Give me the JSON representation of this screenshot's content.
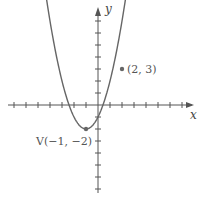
{
  "chart_data": {
    "type": "line",
    "title": "",
    "function": "y = (x + 1)^2 - 2",
    "xlabel": "x",
    "ylabel": "y",
    "xlim": [
      -7,
      8
    ],
    "ylim": [
      -7,
      8
    ],
    "grid": false,
    "tick_spacing": 1,
    "vertex": {
      "x": -1,
      "y": -2,
      "label": "V(−1, −2)"
    },
    "points": [
      {
        "x": -1,
        "y": -2,
        "label": "V(−1, −2)"
      },
      {
        "x": 2,
        "y": 3,
        "label": "(2, 3)"
      }
    ],
    "annotations": [
      "V(−1, −2)",
      "(2, 3)"
    ]
  }
}
